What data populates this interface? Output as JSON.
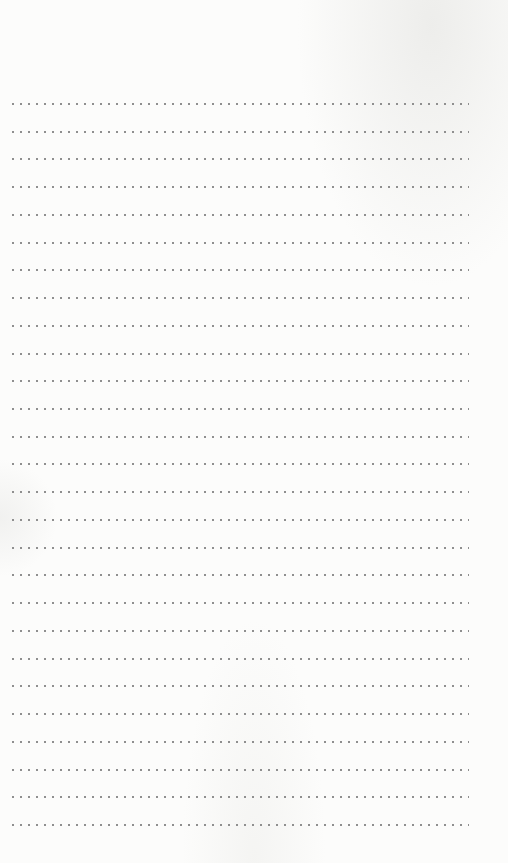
{
  "page": {
    "type": "dotted-ruled-notepaper",
    "background_color": "#fcfcfb",
    "dot_color": "#8f8f8f",
    "line_count": 27,
    "first_line_y": 104,
    "line_spacing": 27.73,
    "line_left_x": 9,
    "line_right_x": 468,
    "dot_spacing": 8,
    "lines": [
      {
        "text": ""
      },
      {
        "text": ""
      },
      {
        "text": ""
      },
      {
        "text": ""
      },
      {
        "text": ""
      },
      {
        "text": ""
      },
      {
        "text": ""
      },
      {
        "text": ""
      },
      {
        "text": ""
      },
      {
        "text": ""
      },
      {
        "text": ""
      },
      {
        "text": ""
      },
      {
        "text": ""
      },
      {
        "text": ""
      },
      {
        "text": ""
      },
      {
        "text": ""
      },
      {
        "text": ""
      },
      {
        "text": ""
      },
      {
        "text": ""
      },
      {
        "text": ""
      },
      {
        "text": ""
      },
      {
        "text": ""
      },
      {
        "text": ""
      },
      {
        "text": ""
      },
      {
        "text": ""
      },
      {
        "text": ""
      },
      {
        "text": ""
      }
    ]
  }
}
